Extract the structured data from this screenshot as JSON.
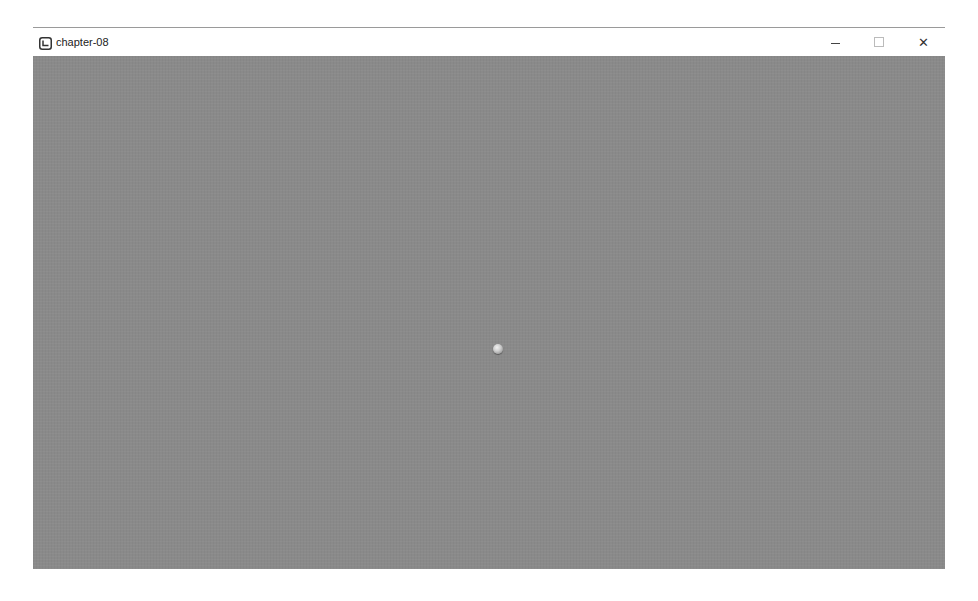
{
  "window": {
    "title": "chapter-08",
    "app_icon": "app-logo-icon",
    "controls": {
      "minimize": "minimize-icon",
      "maximize": "maximize-icon",
      "close_label": "✕"
    }
  },
  "viewport": {
    "background_color": "#8a8a8a",
    "objects": [
      {
        "type": "sphere",
        "color": "#dcdcdc"
      }
    ]
  }
}
